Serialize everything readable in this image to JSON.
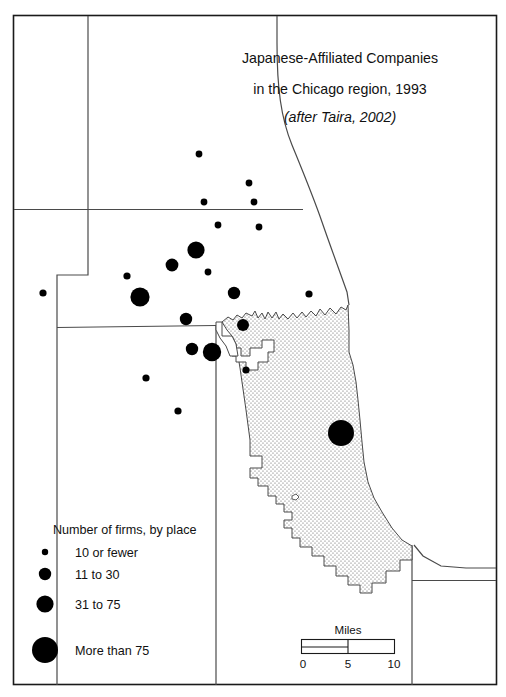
{
  "figure": {
    "title_line1": "Japanese-Affiliated Companies",
    "title_line2": "in the Chicago region, 1993",
    "title_line3": "(after Taira, 2002)"
  },
  "legend": {
    "heading": "Number of firms, by  place",
    "classes": [
      {
        "label": "10 or fewer",
        "radius": 3.2,
        "min": 1,
        "max": 10
      },
      {
        "label": "11 to 30",
        "radius": 6.2,
        "min": 11,
        "max": 30
      },
      {
        "label": "31 to 75",
        "radius": 8.6,
        "min": 31,
        "max": 75
      },
      {
        "label": "More than 75",
        "radius": 13.0,
        "min": 76,
        "max": null
      }
    ]
  },
  "scale_bar": {
    "units_label": "Miles",
    "ticks": [
      "0",
      "5",
      "10"
    ],
    "min": 0,
    "mid": 5,
    "max": 10
  },
  "colors": {
    "ink": "#000000",
    "frame": "#1a1a1a",
    "boundary": "#4a4a4a",
    "paper": "#ffffff",
    "city_fill": "#e8e8e8"
  },
  "chart_data": {
    "type": "scatter",
    "title": "Japanese-Affiliated Companies in the Chicago region, 1993",
    "subtitle": "(after Taira, 2002)",
    "xlabel": "",
    "ylabel": "",
    "grid": false,
    "legend_position": "lower-left",
    "symbol_encoding": "proportional circle area = number of firms at place",
    "size_classes": [
      "10 or fewer",
      "11 to 30",
      "31 to 75",
      "More than 75"
    ],
    "points": [
      {
        "x": 199,
        "y": 154,
        "r": 3.4,
        "class": "10 or fewer"
      },
      {
        "x": 249,
        "y": 183,
        "r": 3.4,
        "class": "10 or fewer"
      },
      {
        "x": 204,
        "y": 202,
        "r": 3.4,
        "class": "10 or fewer"
      },
      {
        "x": 254,
        "y": 202,
        "r": 3.4,
        "class": "10 or fewer"
      },
      {
        "x": 218,
        "y": 225,
        "r": 3.4,
        "class": "10 or fewer"
      },
      {
        "x": 259,
        "y": 227,
        "r": 3.4,
        "class": "10 or fewer"
      },
      {
        "x": 196,
        "y": 250,
        "r": 8.6,
        "class": "31 to 75"
      },
      {
        "x": 172,
        "y": 265,
        "r": 6.4,
        "class": "11 to 30"
      },
      {
        "x": 127,
        "y": 276,
        "r": 3.6,
        "class": "10 or fewer"
      },
      {
        "x": 208,
        "y": 272,
        "r": 3.4,
        "class": "10 or fewer"
      },
      {
        "x": 140,
        "y": 297,
        "r": 9.6,
        "class": "31 to 75"
      },
      {
        "x": 234,
        "y": 293,
        "r": 6.2,
        "class": "11 to 30"
      },
      {
        "x": 309,
        "y": 294,
        "r": 3.6,
        "class": "10 or fewer"
      },
      {
        "x": 43,
        "y": 293,
        "r": 3.6,
        "class": "10 or fewer"
      },
      {
        "x": 186,
        "y": 319,
        "r": 6.2,
        "class": "11 to 30"
      },
      {
        "x": 243,
        "y": 325,
        "r": 6.0,
        "class": "11 to 30"
      },
      {
        "x": 192,
        "y": 349,
        "r": 6.2,
        "class": "11 to 30"
      },
      {
        "x": 212,
        "y": 352,
        "r": 9.2,
        "class": "31 to 75"
      },
      {
        "x": 146,
        "y": 378,
        "r": 3.6,
        "class": "10 or fewer"
      },
      {
        "x": 246,
        "y": 370,
        "r": 3.6,
        "class": "10 or fewer"
      },
      {
        "x": 178,
        "y": 411,
        "r": 3.6,
        "class": "10 or fewer"
      },
      {
        "x": 341,
        "y": 433,
        "r": 13.0,
        "class": "More than 75"
      }
    ]
  }
}
